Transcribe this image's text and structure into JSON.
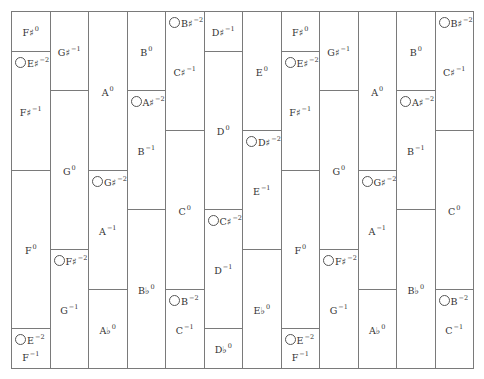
{
  "diagram": {
    "title": "",
    "columns": [
      {
        "cells": [
          {
            "top": 0,
            "bottom": 40,
            "notes": [
              {
                "text": "F♯",
                "exp": "0",
                "pos": "center",
                "ring": false
              }
            ]
          },
          {
            "top": 40,
            "bottom": 159,
            "notes": [
              {
                "text": "E♯",
                "exp": "−2",
                "pos": "top",
                "ring": true
              },
              {
                "text": "F♯",
                "exp": "−1",
                "pos": "center",
                "ring": false
              }
            ]
          },
          {
            "top": 159,
            "bottom": 317,
            "notes": [
              {
                "text": "F",
                "exp": "0",
                "pos": "center",
                "ring": false
              }
            ]
          },
          {
            "top": 317,
            "bottom": 357,
            "notes": [
              {
                "text": "E",
                "exp": "−2",
                "pos": "top",
                "ring": true
              },
              {
                "text": "F",
                "exp": "−1",
                "pos": "bottom",
                "ring": false
              }
            ]
          }
        ]
      },
      {
        "cells": [
          {
            "top": 0,
            "bottom": 79,
            "notes": [
              {
                "text": "G♯",
                "exp": "−1",
                "pos": "center",
                "ring": false
              }
            ]
          },
          {
            "top": 79,
            "bottom": 238,
            "notes": [
              {
                "text": "G",
                "exp": "0",
                "pos": "center",
                "ring": false
              }
            ]
          },
          {
            "top": 238,
            "bottom": 357,
            "notes": [
              {
                "text": "F♯",
                "exp": "−2",
                "pos": "top",
                "ring": true
              },
              {
                "text": "G",
                "exp": "−1",
                "pos": "center",
                "ring": false
              }
            ]
          }
        ]
      },
      {
        "cells": [
          {
            "top": 0,
            "bottom": 159,
            "notes": [
              {
                "text": "A",
                "exp": "0",
                "pos": "center",
                "ring": false
              }
            ]
          },
          {
            "top": 159,
            "bottom": 278,
            "notes": [
              {
                "text": "G♯",
                "exp": "−2",
                "pos": "top",
                "ring": true
              },
              {
                "text": "A",
                "exp": "−1",
                "pos": "center",
                "ring": false
              }
            ]
          },
          {
            "top": 278,
            "bottom": 357,
            "notes": [
              {
                "text": "A♭",
                "exp": "0",
                "pos": "center",
                "ring": false
              }
            ]
          }
        ]
      },
      {
        "cells": [
          {
            "top": 0,
            "bottom": 79,
            "notes": [
              {
                "text": "B",
                "exp": "0",
                "pos": "center",
                "ring": false
              }
            ]
          },
          {
            "top": 79,
            "bottom": 198,
            "notes": [
              {
                "text": "A♯",
                "exp": "−2",
                "pos": "top",
                "ring": true
              },
              {
                "text": "B",
                "exp": "−1",
                "pos": "center",
                "ring": false
              }
            ]
          },
          {
            "top": 198,
            "bottom": 357,
            "notes": [
              {
                "text": "B♭",
                "exp": "0",
                "pos": "center",
                "ring": false
              }
            ]
          }
        ]
      },
      {
        "cells": [
          {
            "top": 0,
            "bottom": 119,
            "notes": [
              {
                "text": "B♯",
                "exp": "−2",
                "pos": "top",
                "ring": true
              },
              {
                "text": "C♯",
                "exp": "−1",
                "pos": "center",
                "ring": false
              }
            ]
          },
          {
            "top": 119,
            "bottom": 278,
            "notes": [
              {
                "text": "C",
                "exp": "0",
                "pos": "center",
                "ring": false
              }
            ]
          },
          {
            "top": 278,
            "bottom": 357,
            "notes": [
              {
                "text": "B",
                "exp": "−2",
                "pos": "top",
                "ring": true
              },
              {
                "text": "C",
                "exp": "−1",
                "pos": "center",
                "ring": false
              }
            ]
          }
        ]
      },
      {
        "cells": [
          {
            "top": 0,
            "bottom": 40,
            "notes": [
              {
                "text": "D♯",
                "exp": "−1",
                "pos": "center",
                "ring": false
              }
            ]
          },
          {
            "top": 40,
            "bottom": 198,
            "notes": [
              {
                "text": "D",
                "exp": "0",
                "pos": "center",
                "ring": false
              }
            ]
          },
          {
            "top": 198,
            "bottom": 317,
            "notes": [
              {
                "text": "C♯",
                "exp": "−2",
                "pos": "top",
                "ring": true
              },
              {
                "text": "D",
                "exp": "−1",
                "pos": "center",
                "ring": false
              }
            ]
          },
          {
            "top": 317,
            "bottom": 357,
            "notes": [
              {
                "text": "D♭",
                "exp": "0",
                "pos": "center",
                "ring": false
              }
            ]
          }
        ]
      },
      {
        "cells": [
          {
            "top": 0,
            "bottom": 119,
            "notes": [
              {
                "text": "E",
                "exp": "0",
                "pos": "center",
                "ring": false
              }
            ]
          },
          {
            "top": 119,
            "bottom": 238,
            "notes": [
              {
                "text": "D♯",
                "exp": "−2",
                "pos": "top",
                "ring": true
              },
              {
                "text": "E",
                "exp": "−1",
                "pos": "center",
                "ring": false
              }
            ]
          },
          {
            "top": 238,
            "bottom": 357,
            "notes": [
              {
                "text": "E♭",
                "exp": "0",
                "pos": "center",
                "ring": false
              }
            ]
          }
        ]
      },
      {
        "cells": [
          {
            "top": 0,
            "bottom": 40,
            "notes": [
              {
                "text": "F♯",
                "exp": "0",
                "pos": "center",
                "ring": false
              }
            ]
          },
          {
            "top": 40,
            "bottom": 159,
            "notes": [
              {
                "text": "E♯",
                "exp": "−2",
                "pos": "top",
                "ring": true
              },
              {
                "text": "F♯",
                "exp": "−1",
                "pos": "center",
                "ring": false
              }
            ]
          },
          {
            "top": 159,
            "bottom": 317,
            "notes": [
              {
                "text": "F",
                "exp": "0",
                "pos": "center",
                "ring": false
              }
            ]
          },
          {
            "top": 317,
            "bottom": 357,
            "notes": [
              {
                "text": "E",
                "exp": "−2",
                "pos": "top",
                "ring": true
              },
              {
                "text": "F",
                "exp": "−1",
                "pos": "bottom",
                "ring": false
              }
            ]
          }
        ]
      },
      {
        "cells": [
          {
            "top": 0,
            "bottom": 79,
            "notes": [
              {
                "text": "G♯",
                "exp": "−1",
                "pos": "center",
                "ring": false
              }
            ]
          },
          {
            "top": 79,
            "bottom": 238,
            "notes": [
              {
                "text": "G",
                "exp": "0",
                "pos": "center",
                "ring": false
              }
            ]
          },
          {
            "top": 238,
            "bottom": 357,
            "notes": [
              {
                "text": "F♯",
                "exp": "−2",
                "pos": "top",
                "ring": true
              },
              {
                "text": "G",
                "exp": "−1",
                "pos": "center",
                "ring": false
              }
            ]
          }
        ]
      },
      {
        "cells": [
          {
            "top": 0,
            "bottom": 159,
            "notes": [
              {
                "text": "A",
                "exp": "0",
                "pos": "center",
                "ring": false
              }
            ]
          },
          {
            "top": 159,
            "bottom": 278,
            "notes": [
              {
                "text": "G♯",
                "exp": "−2",
                "pos": "top",
                "ring": true
              },
              {
                "text": "A",
                "exp": "−1",
                "pos": "center",
                "ring": false
              }
            ]
          },
          {
            "top": 278,
            "bottom": 357,
            "notes": [
              {
                "text": "A♭",
                "exp": "0",
                "pos": "center",
                "ring": false
              }
            ]
          }
        ]
      },
      {
        "cells": [
          {
            "top": 0,
            "bottom": 79,
            "notes": [
              {
                "text": "B",
                "exp": "0",
                "pos": "center",
                "ring": false
              }
            ]
          },
          {
            "top": 79,
            "bottom": 198,
            "notes": [
              {
                "text": "A♯",
                "exp": "−2",
                "pos": "top",
                "ring": true
              },
              {
                "text": "B",
                "exp": "−1",
                "pos": "center",
                "ring": false
              }
            ]
          },
          {
            "top": 198,
            "bottom": 357,
            "notes": [
              {
                "text": "B♭",
                "exp": "0",
                "pos": "center",
                "ring": false
              }
            ]
          }
        ]
      },
      {
        "cells": [
          {
            "top": 0,
            "bottom": 119,
            "notes": [
              {
                "text": "B♯",
                "exp": "−2",
                "pos": "top",
                "ring": true
              },
              {
                "text": "C♯",
                "exp": "−1",
                "pos": "center",
                "ring": false
              }
            ]
          },
          {
            "top": 119,
            "bottom": 278,
            "notes": [
              {
                "text": "C",
                "exp": "0",
                "pos": "center",
                "ring": false
              }
            ]
          },
          {
            "top": 278,
            "bottom": 357,
            "notes": [
              {
                "text": "B",
                "exp": "−2",
                "pos": "top",
                "ring": true
              },
              {
                "text": "C",
                "exp": "−1",
                "pos": "center",
                "ring": false
              }
            ]
          }
        ]
      }
    ]
  }
}
